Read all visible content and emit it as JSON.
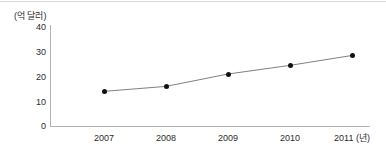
{
  "chart_data": {
    "type": "line",
    "title": "",
    "subtitle": "",
    "xlabel": "(년)",
    "ylabel": "(억 달러)",
    "categories": [
      "2007",
      "2008",
      "2009",
      "2010",
      "2011"
    ],
    "values": [
      14,
      16,
      21,
      24.5,
      28.5
    ],
    "series": [
      {
        "name": "",
        "values": [
          14,
          16,
          21,
          24.5,
          28.5
        ]
      }
    ],
    "ylim": [
      0,
      40
    ],
    "yticks": [
      0,
      10,
      20,
      30,
      40
    ],
    "ytick_labels": [
      "0",
      "10",
      "20",
      "30",
      "40"
    ],
    "xtick_labels": [
      "2007",
      "2008",
      "2009",
      "2010",
      "2011 (년)"
    ],
    "grid": false,
    "legend": false,
    "legend_position": "none",
    "marker": "filled-circle",
    "line_color": "#808080",
    "marker_color": "#111111",
    "axis_color": "#b3b3b3",
    "text_color": "#2b2b2b",
    "background_color": "#ffffff"
  },
  "axes": {
    "unit_caption": "(억 달러)",
    "x_unit_suffix": "(년)"
  }
}
